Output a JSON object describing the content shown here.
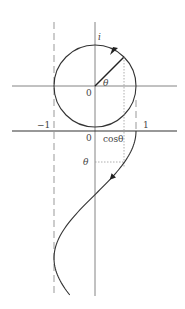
{
  "diagram": {
    "labels": {
      "imag_axis": "i",
      "angle": "θ",
      "origin_top": "0",
      "origin_bottom": "0",
      "neg_one": "−1",
      "pos_one": "1",
      "cos_label": "cosθ",
      "theta_axis": "θ"
    },
    "angle_theta_rad": 0.785,
    "colors": {
      "curve": "#333333",
      "axis": "#555555",
      "dashed": "#888888",
      "dotted": "#999999"
    }
  }
}
